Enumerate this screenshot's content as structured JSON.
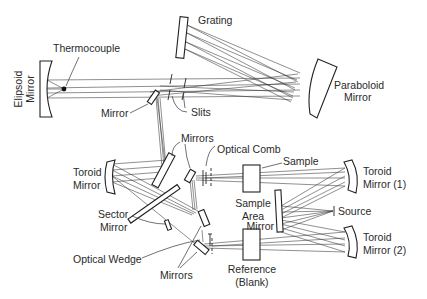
{
  "diagram": {
    "type": "optical-schematic",
    "colors": {
      "ink": "#222222",
      "background": "#ffffff"
    },
    "labels": {
      "grating": "Grating",
      "thermocouple": "Thermocouple",
      "ellipsoid_mirror": "Elipsoid Mirror",
      "ellipsoid_line1": "Elipsoid",
      "ellipsoid_line2": "Mirror",
      "mirror_top": "Mirror",
      "slits": "Slits",
      "paraboloid_line1": "Paraboloid",
      "paraboloid_line2": "Mirror",
      "mirrors_upper": "Mirrors",
      "optical_comb": "Optical Comb",
      "sample": "Sample",
      "toroid_left_line1": "Toroid",
      "toroid_left_line2": "Mirror",
      "sample_area_line1": "Sample",
      "sample_area_line2": "Area",
      "toroid1_line1": "Toroid",
      "toroid1_line2": "Mirror (1)",
      "source": "Source",
      "mirror_source": "Mirror",
      "sector_line1": "Sector",
      "sector_line2": "Mirror",
      "toroid2_line1": "Toroid",
      "toroid2_line2": "Mirror (2)",
      "optical_wedge": "Optical Wedge",
      "mirrors_lower": "Mirrors",
      "reference_line1": "Reference",
      "reference_line2": "(Blank)"
    }
  }
}
